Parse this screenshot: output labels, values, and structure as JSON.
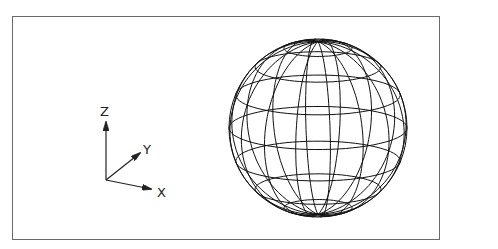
{
  "viewport": {
    "background": "#ffffff",
    "border_color": "#6a6a6a"
  },
  "ucs_icon": {
    "labels": {
      "z": "Z",
      "y": "Y",
      "x": "X"
    },
    "color": "#222222"
  },
  "sphere": {
    "type": "wireframe-sphere",
    "center": [
      318,
      128
    ],
    "radius": 89,
    "tilt_deg": 14,
    "rotation_deg": 8,
    "latitude_count": 8,
    "longitude_count": 16,
    "line_color": "#111111"
  }
}
